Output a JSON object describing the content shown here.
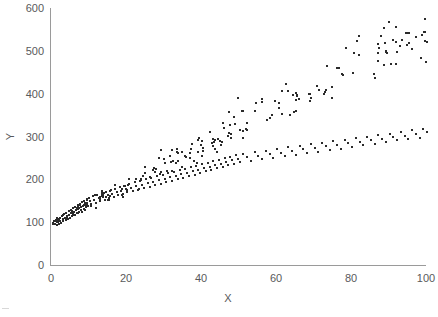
{
  "chart_data": {
    "type": "scatter",
    "title": "",
    "xlabel": "X",
    "ylabel": "Y",
    "xlim": [
      0,
      100
    ],
    "ylim": [
      0,
      600
    ],
    "xticks": [
      0,
      20,
      40,
      60,
      80,
      100
    ],
    "yticks": [
      0,
      100,
      200,
      300,
      400,
      500,
      600
    ],
    "xtick_labels": [
      "0",
      "20",
      "40",
      "60",
      "80",
      "100"
    ],
    "ytick_labels": [
      "0",
      "100",
      "200",
      "300",
      "400",
      "500",
      "600"
    ],
    "grid": false,
    "legend": null,
    "marker_color": "#2b2b2b",
    "axis_color": "#9a9a9a",
    "text_color": "#59595b",
    "background_color": "#ffffff",
    "n_points": 400,
    "trend": "y = 100 + 4.5x with variance increasing in x",
    "points": [
      [
        0.2,
        101
      ],
      [
        0.4,
        97
      ],
      [
        0.6,
        105
      ],
      [
        0.8,
        99
      ],
      [
        1.0,
        108
      ],
      [
        1.2,
        96
      ],
      [
        1.4,
        110
      ],
      [
        1.6,
        103
      ],
      [
        1.8,
        99
      ],
      [
        2.0,
        113
      ],
      [
        2.2,
        106
      ],
      [
        2.4,
        100
      ],
      [
        2.6,
        117
      ],
      [
        2.8,
        109
      ],
      [
        3.0,
        104
      ],
      [
        3.2,
        121
      ],
      [
        3.4,
        112
      ],
      [
        3.6,
        107
      ],
      [
        3.8,
        124
      ],
      [
        4.0,
        116
      ],
      [
        4.2,
        110
      ],
      [
        4.4,
        128
      ],
      [
        4.6,
        119
      ],
      [
        4.8,
        113
      ],
      [
        5.0,
        131
      ],
      [
        5.2,
        123
      ],
      [
        5.4,
        116
      ],
      [
        5.6,
        135
      ],
      [
        5.8,
        126
      ],
      [
        6.0,
        120
      ],
      [
        6.2,
        138
      ],
      [
        6.4,
        130
      ],
      [
        6.6,
        123
      ],
      [
        6.8,
        142
      ],
      [
        7.0,
        133
      ],
      [
        7.2,
        126
      ],
      [
        7.4,
        145
      ],
      [
        7.6,
        137
      ],
      [
        7.8,
        130
      ],
      [
        8.0,
        149
      ],
      [
        8.2,
        140
      ],
      [
        8.4,
        133
      ],
      [
        8.6,
        152
      ],
      [
        8.8,
        144
      ],
      [
        9.0,
        137
      ],
      [
        9.2,
        156
      ],
      [
        9.4,
        147
      ],
      [
        9.6,
        140
      ],
      [
        9.8,
        159
      ],
      [
        10.0,
        151
      ],
      [
        10.4,
        144
      ],
      [
        10.8,
        163
      ],
      [
        11.2,
        155
      ],
      [
        11.6,
        147
      ],
      [
        12.0,
        166
      ],
      [
        12.4,
        158
      ],
      [
        12.8,
        151
      ],
      [
        13.2,
        170
      ],
      [
        13.6,
        162
      ],
      [
        14.0,
        154
      ],
      [
        14.4,
        173
      ],
      [
        14.8,
        165
      ],
      [
        15.2,
        158
      ],
      [
        15.6,
        177
      ],
      [
        16.0,
        169
      ],
      [
        16.4,
        161
      ],
      [
        16.8,
        180
      ],
      [
        17.2,
        172
      ],
      [
        17.6,
        165
      ],
      [
        18.0,
        184
      ],
      [
        18.4,
        176
      ],
      [
        18.8,
        168
      ],
      [
        19.2,
        187
      ],
      [
        19.6,
        179
      ],
      [
        20.0,
        172
      ],
      [
        20.5,
        191
      ],
      [
        21.0,
        183
      ],
      [
        21.5,
        175
      ],
      [
        22.0,
        195
      ],
      [
        22.5,
        186
      ],
      [
        23.0,
        178
      ],
      [
        23.5,
        198
      ],
      [
        24.0,
        190
      ],
      [
        24.5,
        182
      ],
      [
        25.0,
        202
      ],
      [
        25.5,
        193
      ],
      [
        26.0,
        185
      ],
      [
        26.5,
        205
      ],
      [
        27.0,
        197
      ],
      [
        27.5,
        189
      ],
      [
        28.0,
        209
      ],
      [
        28.5,
        200
      ],
      [
        29.0,
        192
      ],
      [
        29.5,
        212
      ],
      [
        30.0,
        204
      ],
      [
        30.5,
        196
      ],
      [
        31.0,
        216
      ],
      [
        31.5,
        207
      ],
      [
        32.0,
        199
      ],
      [
        32.5,
        219
      ],
      [
        33.0,
        211
      ],
      [
        33.5,
        203
      ],
      [
        34.0,
        223
      ],
      [
        34.5,
        214
      ],
      [
        35.0,
        206
      ],
      [
        35.5,
        227
      ],
      [
        36.0,
        218
      ],
      [
        36.5,
        210
      ],
      [
        37.0,
        230
      ],
      [
        37.5,
        222
      ],
      [
        38.0,
        213
      ],
      [
        38.5,
        234
      ],
      [
        39.0,
        225
      ],
      [
        39.5,
        217
      ],
      [
        40.0,
        237
      ],
      [
        40.5,
        229
      ],
      [
        41.0,
        221
      ],
      [
        41.5,
        241
      ],
      [
        42.0,
        232
      ],
      [
        42.5,
        224
      ],
      [
        43.0,
        244
      ],
      [
        43.5,
        236
      ],
      [
        44.0,
        228
      ],
      [
        44.5,
        248
      ],
      [
        45.0,
        239
      ],
      [
        45.5,
        231
      ],
      [
        46.0,
        252
      ],
      [
        46.5,
        243
      ],
      [
        47.0,
        235
      ],
      [
        47.5,
        255
      ],
      [
        48.0,
        247
      ],
      [
        48.5,
        238
      ],
      [
        49.0,
        259
      ],
      [
        49.5,
        250
      ],
      [
        50.0,
        242
      ],
      [
        51.0,
        262
      ],
      [
        52.0,
        254
      ],
      [
        53.0,
        246
      ],
      [
        54.0,
        266
      ],
      [
        55.0,
        257
      ],
      [
        56.0,
        249
      ],
      [
        57.0,
        269
      ],
      [
        58.0,
        261
      ],
      [
        59.0,
        253
      ],
      [
        60.0,
        273
      ],
      [
        61.0,
        264
      ],
      [
        62.0,
        256
      ],
      [
        63.0,
        277
      ],
      [
        64.0,
        268
      ],
      [
        65.0,
        260
      ],
      [
        66.0,
        280
      ],
      [
        67.0,
        272
      ],
      [
        68.0,
        263
      ],
      [
        69.0,
        284
      ],
      [
        70.0,
        275
      ],
      [
        71.0,
        267
      ],
      [
        72.0,
        288
      ],
      [
        73.0,
        279
      ],
      [
        74.0,
        271
      ],
      [
        75.0,
        291
      ],
      [
        76.0,
        283
      ],
      [
        77.0,
        274
      ],
      [
        78.0,
        295
      ],
      [
        79.0,
        286
      ],
      [
        80.0,
        278
      ],
      [
        81.0,
        298
      ],
      [
        82.0,
        290
      ],
      [
        83.0,
        282
      ],
      [
        84.0,
        302
      ],
      [
        85.0,
        293
      ],
      [
        86.0,
        285
      ],
      [
        87.0,
        306
      ],
      [
        88.0,
        297
      ],
      [
        89.0,
        289
      ],
      [
        90.0,
        309
      ],
      [
        91.0,
        301
      ],
      [
        92.0,
        293
      ],
      [
        93.0,
        313
      ],
      [
        94.0,
        304
      ],
      [
        95.0,
        296
      ],
      [
        96.0,
        317
      ],
      [
        97.0,
        308
      ],
      [
        98.0,
        300
      ],
      [
        99.0,
        320
      ],
      [
        100.0,
        312
      ]
    ]
  },
  "axes": {
    "y_title": "Y",
    "x_title": "X"
  }
}
